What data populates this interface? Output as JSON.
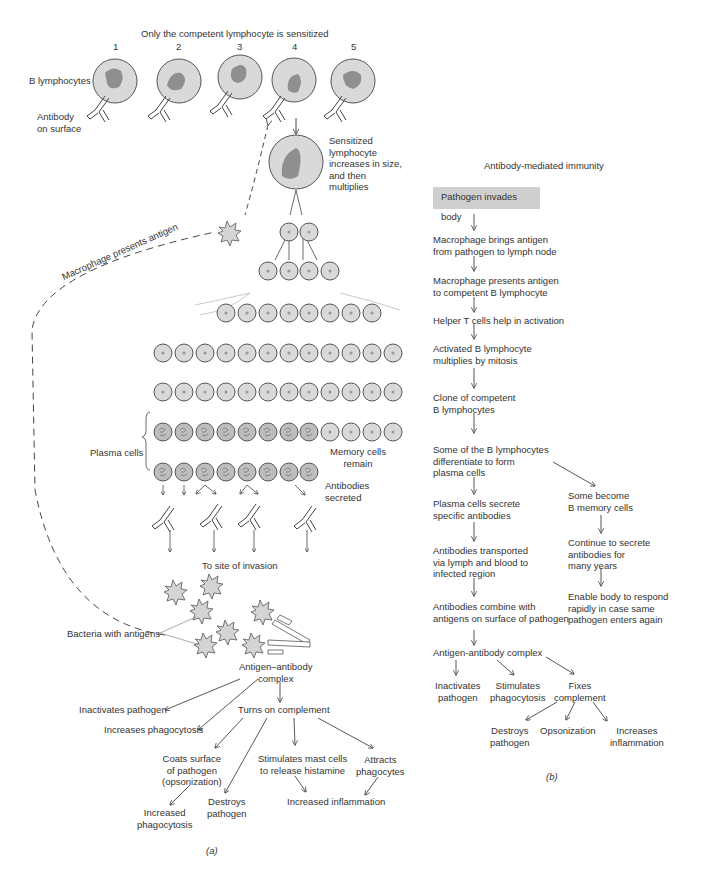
{
  "panel_a": {
    "title": "Only the competent lymphocyte is sensitized",
    "lymphocyte_numbers": [
      "1",
      "2",
      "3",
      "4",
      "5"
    ],
    "labels": {
      "b_lymphocytes": "B lymphocytes",
      "antibody_on_surface": "Antibody\non surface",
      "sensitized": "Sensitized\nlymphocyte\nincreases in size,\nand then\nmultiplies",
      "macrophage_presents": "Macrophage presents antigen",
      "plasma_cells": "Plasma cells",
      "memory_cells": "Memory cells\nremain",
      "antibodies_secreted": "Antibodies\nsecreted",
      "to_site": "To site of invasion",
      "bacteria": "Bacteria with antigens",
      "complex": "Antigen–antibody\ncomplex",
      "inactivates": "Inactivates pathogen",
      "increases_phago": "Increases phagocytosis",
      "turns_on": "Turns on complement",
      "coats": "Coats surface\nof pathogen\n(opsonization)",
      "stimulates_mast": "Stimulates mast cells\nto release histamine",
      "attracts": "Attracts\nphagocytes",
      "increased_phago": "Increased\nphagocytosis",
      "destroys": "Destroys\npathogen",
      "increased_inflam": "Increased inflammation"
    },
    "caption": "(a)"
  },
  "panel_b": {
    "title": "Antibody-mediated immunity",
    "start_box": "Pathogen invades body",
    "steps": [
      "Macrophage brings antigen\nfrom pathogen to lymph node",
      "Macrophage presents antigen\nto competent B lymphocyte",
      "Helper T cells help in activation",
      "Activated B lymphocyte\nmultiplies by mitosis",
      "Clone of competent\nB lymphocytes",
      "Some of the B lymphocytes\ndifferentiate to form\nplasma cells",
      "Plasma cells secrete\nspecific antibodies",
      "Antibodies transported\nvia lymph and blood to\ninfected region",
      "Antibodies combine with\nantigens on surface of pathogen",
      "Antigen-antibody complex"
    ],
    "memory_branch": [
      "Some become\nB memory cells",
      "Continue to secrete\nantibodies for\nmany years",
      "Enable body to respond\nrapidly in case same\npathogen enters again"
    ],
    "outcomes": [
      "Inactivates\npathogen",
      "Stimulates\nphagocytosis",
      "Fixes\ncomplement"
    ],
    "complement_outcomes": [
      "Destroys\npathogen",
      "Opsonization",
      "Increases\ninflammation"
    ],
    "caption": "(b)"
  },
  "colors": {
    "cell_fill": "#d9d9d9",
    "nucleus_fill": "#8f8f8f",
    "box_fill": "#cfcfcf",
    "line": "#444444"
  }
}
